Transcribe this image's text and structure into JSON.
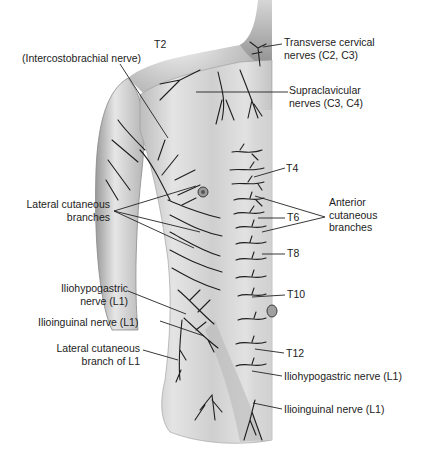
{
  "figure": {
    "labels": {
      "t2": "T2",
      "intercostobrachial": "(Intercostobrachial nerve)",
      "transverse_cervical": [
        "Transverse cervical",
        "nerves (C2, C3)"
      ],
      "supraclavicular": [
        "Supraclavicular",
        "nerves (C3, C4)"
      ],
      "t4": "T4",
      "lateral_cutaneous_branches": [
        "Lateral cutaneous",
        "branches"
      ],
      "anterior_cutaneous_branches": [
        "Anterior",
        "cutaneous",
        "branches"
      ],
      "t6": "T6",
      "t8": "T8",
      "t10": "T10",
      "t12": "T12",
      "iliohypogastric_left": [
        "Iliohypogastric",
        "nerve (L1)"
      ],
      "ilioinguinal_left": "Ilioinguinal nerve (L1)",
      "lateral_cutaneous_l1": [
        "Lateral cutaneous",
        "branch of L1"
      ],
      "iliohypogastric_right": "Iliohypogastric nerve (L1)",
      "ilioinguinal_right": "Ilioinguinal nerve (L1)"
    },
    "colors": {
      "skin_light": "#ededed",
      "skin_mid": "#c9c9c9",
      "skin_dark": "#8f8f8f",
      "nerve": "#1e1e1e",
      "leader": "#222222"
    }
  }
}
